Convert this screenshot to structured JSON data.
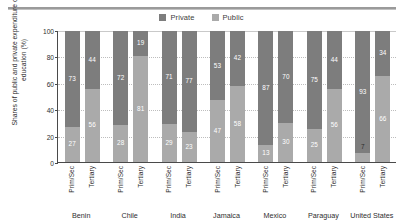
{
  "chart_data": {
    "type": "bar",
    "subtype": "stacked-100-percent",
    "title": "",
    "xlabel": "",
    "ylabel": "Shares of public and private expenditure on education (%)",
    "ylim": [
      0,
      100
    ],
    "yticks": [
      0,
      20,
      40,
      60,
      80,
      100
    ],
    "grid": true,
    "legend_position": "top-center",
    "legend": [
      {
        "name": "Private",
        "color": "#7d7d7d"
      },
      {
        "name": "Public",
        "color": "#aaaaaa"
      }
    ],
    "categories": [
      "Benin",
      "Chile",
      "India",
      "Jamaica",
      "Mexico",
      "Paraguay",
      "United States"
    ],
    "subcategories": [
      "Prim/Sec",
      "Tertiary"
    ],
    "groups": [
      {
        "country": "Benin",
        "bars": [
          {
            "level": "Prim/Sec",
            "public": 27,
            "private": 73
          },
          {
            "level": "Tertiary",
            "public": 56,
            "private": 44
          }
        ]
      },
      {
        "country": "Chile",
        "bars": [
          {
            "level": "Prim/Sec",
            "public": 28,
            "private": 72
          },
          {
            "level": "Tertiary",
            "public": 81,
            "private": 19
          }
        ]
      },
      {
        "country": "India",
        "bars": [
          {
            "level": "Prim/Sec",
            "public": 29,
            "private": 71
          },
          {
            "level": "Tertiary",
            "public": 23,
            "private": 77
          }
        ]
      },
      {
        "country": "Jamaica",
        "bars": [
          {
            "level": "Prim/Sec",
            "public": 47,
            "private": 53
          },
          {
            "level": "Tertiary",
            "public": 58,
            "private": 42
          }
        ]
      },
      {
        "country": "Mexico",
        "bars": [
          {
            "level": "Prim/Sec",
            "public": 13,
            "private": 87
          },
          {
            "level": "Tertiary",
            "public": 30,
            "private": 70
          }
        ]
      },
      {
        "country": "Paraguay",
        "bars": [
          {
            "level": "Prim/Sec",
            "public": 25,
            "private": 75
          },
          {
            "level": "Tertiary",
            "public": 56,
            "private": 44
          }
        ]
      },
      {
        "country": "United States",
        "bars": [
          {
            "level": "Prim/Sec",
            "public": 7,
            "private": 93
          },
          {
            "level": "Tertiary",
            "public": 66,
            "private": 34
          }
        ]
      }
    ]
  },
  "colors": {
    "private": "#7d7d7d",
    "public": "#aaaaaa",
    "axis": "#4a4a4a",
    "grid": "#bdbdbd",
    "text": "#2e2e2e",
    "rule": "#9a9a9a"
  }
}
